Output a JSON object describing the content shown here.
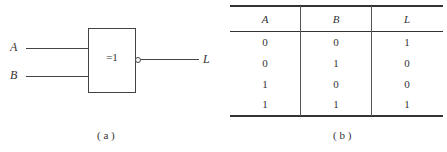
{
  "figure_a": {
    "inputs": [
      {
        "name": "A"
      },
      {
        "name": "B"
      }
    ],
    "gate_symbol": "=1",
    "gate_type": "XNOR (exclusive-OR with inverted output)",
    "output": "L",
    "caption": "( a )"
  },
  "figure_b": {
    "headers": [
      "A",
      "B",
      "L"
    ],
    "rows": [
      [
        "0",
        "0",
        "1"
      ],
      [
        "0",
        "1",
        "0"
      ],
      [
        "1",
        "0",
        "0"
      ],
      [
        "1",
        "1",
        "1"
      ]
    ],
    "caption": "( b )"
  }
}
